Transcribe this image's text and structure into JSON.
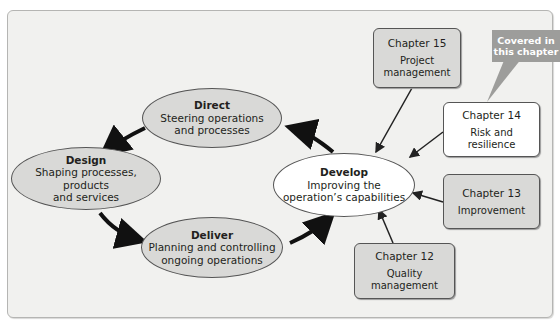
{
  "diagram": {
    "nodes": {
      "direct": {
        "title": "Direct",
        "line1": "Steering operations",
        "line2": "and processes"
      },
      "design": {
        "title": "Design",
        "line1": "Shaping processes, products",
        "line2": "and services"
      },
      "deliver": {
        "title": "Deliver",
        "line1": "Planning and controlling",
        "line2": "ongoing operations"
      },
      "develop": {
        "title": "Develop",
        "line1": "Improving the",
        "line2": "operation’s capabilities"
      }
    },
    "chapters": [
      {
        "chapter": "Chapter 15",
        "line1": "Project",
        "line2": "management"
      },
      {
        "chapter": "Chapter 14",
        "line1": "Risk and",
        "line2": "resilience"
      },
      {
        "chapter": "Chapter 13",
        "line1": "Improvement",
        "line2": ""
      },
      {
        "chapter": "Chapter 12",
        "line1": "Quality",
        "line2": "management"
      }
    ],
    "callout": {
      "line1": "Covered in",
      "line2": "this chapter"
    },
    "colors": {
      "panel": "#f1f1ef",
      "node_grey": "#d9d9d7",
      "callout": "#9d9d9b",
      "highlight": "#ffffff"
    }
  }
}
